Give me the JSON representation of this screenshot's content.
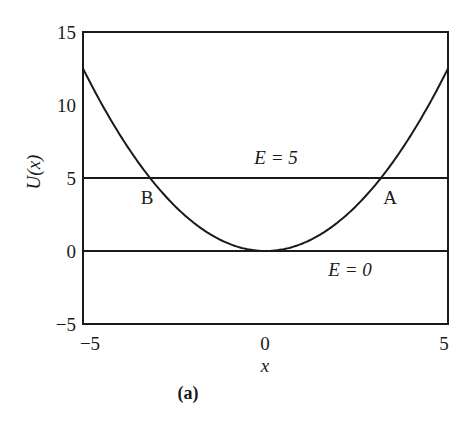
{
  "chart_data": {
    "type": "line",
    "title": "",
    "caption": "(a)",
    "xlabel": "x",
    "ylabel": "U(x)",
    "xlim": [
      -5,
      5
    ],
    "ylim": [
      -5,
      15
    ],
    "x_ticks": [
      "−5",
      "0",
      "5"
    ],
    "y_ticks": [
      "−5",
      "0",
      "5",
      "10",
      "15"
    ],
    "grid": false,
    "legend": null,
    "series": [
      {
        "name": "U(x) = x²/2",
        "function": "0.5*x^2",
        "x": [
          -5,
          -4,
          -3,
          -2,
          -1,
          0,
          1,
          2,
          3,
          4,
          5
        ],
        "values": [
          12.5,
          8,
          4.5,
          2,
          0.5,
          0,
          0.5,
          2,
          4.5,
          8,
          12.5
        ]
      },
      {
        "name": "E = 5",
        "x": [
          -5,
          5
        ],
        "values": [
          5,
          5
        ]
      },
      {
        "name": "E = 0",
        "x": [
          -5,
          5
        ],
        "values": [
          0,
          0
        ]
      }
    ],
    "annotations": [
      {
        "text": "E = 5",
        "x": 0.3,
        "y": 6.5
      },
      {
        "text": "E = 0",
        "x": 2.3,
        "y": -1.3
      },
      {
        "text": "A",
        "x": 3.4,
        "y": 3.6,
        "note": "right turning point x = +√10"
      },
      {
        "text": "B",
        "x": -3.3,
        "y": 3.6,
        "note": "left turning point x = −√10"
      }
    ]
  },
  "labels": {
    "e5": "E = 5",
    "e0": "E = 0",
    "pointA": "A",
    "pointB": "B",
    "xlabel": "x",
    "ylabel": "U(x)",
    "caption": "(a)",
    "xt0": "−5",
    "xt1": "0",
    "xt2": "5",
    "yt0": "−5",
    "yt1": "0",
    "yt2": "5",
    "yt3": "10",
    "yt4": "15"
  }
}
